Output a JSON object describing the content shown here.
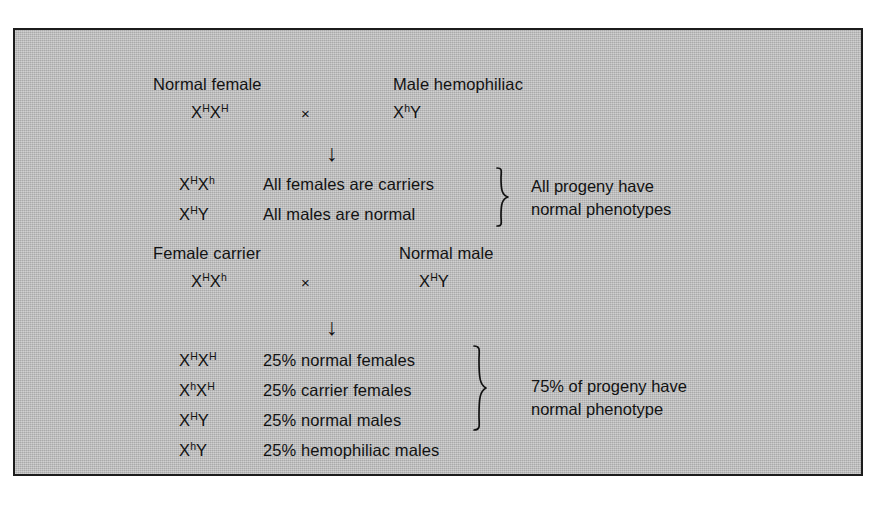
{
  "figure": {
    "name": "x-linked-hemophilia-inheritance",
    "background_color": "#b9b9b9",
    "border_color": "#1c1c1c",
    "text_color": "#121212",
    "cross_symbol": "×",
    "arrow_symbol": "↓"
  },
  "cross_one": {
    "parents": {
      "mother_label": "Normal female",
      "mother_genotype": {
        "locus1": "X",
        "sup1": "H",
        "locus2": "X",
        "sup2": "H"
      },
      "operator": "×",
      "father_label": "Male hemophiliac",
      "father_genotype": {
        "locus1": "X",
        "sup1": "h",
        "locus2": "Y",
        "sup2": ""
      }
    },
    "arrow": "↓",
    "offspring": [
      {
        "genotype": {
          "locus1": "X",
          "sup1": "H",
          "locus2": "X",
          "sup2": "h"
        },
        "phenotype": "All females are carriers"
      },
      {
        "genotype": {
          "locus1": "X",
          "sup1": "H",
          "locus2": "Y",
          "sup2": ""
        },
        "phenotype": "All males are normal"
      }
    ],
    "summary_line1": "All progeny have",
    "summary_line2": "normal phenotypes",
    "brace_rows": 2
  },
  "cross_two": {
    "parents": {
      "mother_label": "Female carrier",
      "mother_genotype": {
        "locus1": "X",
        "sup1": "H",
        "locus2": "X",
        "sup2": "h"
      },
      "operator": "×",
      "father_label": "Normal male",
      "father_genotype": {
        "locus1": "X",
        "sup1": "H",
        "locus2": "Y",
        "sup2": ""
      }
    },
    "arrow": "↓",
    "offspring": [
      {
        "genotype": {
          "locus1": "X",
          "sup1": "H",
          "locus2": "X",
          "sup2": "H"
        },
        "phenotype": "25% normal females",
        "percent": 25
      },
      {
        "genotype": {
          "locus1": "X",
          "sup1": "h",
          "locus2": "X",
          "sup2": "H"
        },
        "phenotype": "25% carrier females",
        "percent": 25
      },
      {
        "genotype": {
          "locus1": "X",
          "sup1": "H",
          "locus2": "Y",
          "sup2": ""
        },
        "phenotype": "25% normal males",
        "percent": 25
      },
      {
        "genotype": {
          "locus1": "X",
          "sup1": "h",
          "locus2": "Y",
          "sup2": ""
        },
        "phenotype": "25% hemophiliac males",
        "percent": 25
      }
    ],
    "summary_line1": "75% of progeny have",
    "summary_line2": "normal phenotype",
    "brace_rows": 3
  }
}
